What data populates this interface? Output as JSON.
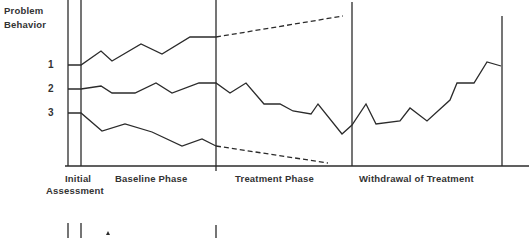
{
  "chart_data": {
    "type": "line",
    "title": "",
    "ylabel": "Problem Behavior",
    "xlabel": "",
    "y_tick_labels": [
      "1",
      "2",
      "3"
    ],
    "phases": [
      {
        "label_line1": "Initial",
        "label_line2": "Assessment"
      },
      {
        "label": "Baseline Phase"
      },
      {
        "label": "Treatment Phase"
      },
      {
        "label": "Withdrawal of Treatment"
      }
    ],
    "phase_boundaries_px": [
      68,
      81,
      216,
      352,
      502
    ],
    "series": [
      {
        "name": "Problem Behavior 1",
        "style": "solid",
        "points": [
          [
            68,
            65
          ],
          [
            81,
            65
          ],
          [
            101,
            51
          ],
          [
            112,
            61
          ],
          [
            141,
            44
          ],
          [
            162,
            54
          ],
          [
            190,
            37
          ],
          [
            216,
            37
          ]
        ],
        "projection": {
          "style": "dashed",
          "points": [
            [
              216,
              37
            ],
            [
              343,
              16
            ]
          ]
        }
      },
      {
        "name": "Problem Behavior 2",
        "style": "solid",
        "points": [
          [
            68,
            89
          ],
          [
            81,
            89
          ],
          [
            101,
            86
          ],
          [
            112,
            93
          ],
          [
            135,
            93
          ],
          [
            156,
            83
          ],
          [
            172,
            93
          ],
          [
            199,
            83
          ],
          [
            216,
            83
          ],
          [
            230,
            93
          ],
          [
            246,
            83
          ],
          [
            264,
            104
          ],
          [
            280,
            104
          ],
          [
            293,
            111
          ],
          [
            311,
            114
          ],
          [
            318,
            104
          ],
          [
            342,
            134
          ],
          [
            352,
            125
          ],
          [
            366,
            104
          ],
          [
            376,
            124
          ],
          [
            400,
            121
          ],
          [
            410,
            108
          ],
          [
            427,
            121
          ],
          [
            450,
            100
          ],
          [
            457,
            83
          ],
          [
            474,
            83
          ],
          [
            487,
            62
          ],
          [
            501,
            66
          ]
        ]
      },
      {
        "name": "Problem Behavior 3",
        "style": "solid",
        "points": [
          [
            68,
            113
          ],
          [
            81,
            113
          ],
          [
            102,
            131
          ],
          [
            125,
            124
          ],
          [
            152,
            132
          ],
          [
            182,
            146
          ],
          [
            202,
            139
          ],
          [
            216,
            146
          ]
        ],
        "projection": {
          "style": "dashed",
          "points": [
            [
              216,
              146
            ],
            [
              328,
              163
            ]
          ]
        }
      }
    ],
    "grid": false,
    "legend": "none",
    "line_color": "#2b2b2b"
  },
  "labels": {
    "y_title_line1": "Problem",
    "y_title_line2": "Behavior",
    "tick_1": "1",
    "tick_2": "2",
    "tick_3": "3",
    "initial_line1": "Initial",
    "initial_line2": "Assessment",
    "baseline": "Baseline Phase",
    "treatment": "Treatment Phase",
    "withdrawal": "Withdrawal of Treatment"
  }
}
